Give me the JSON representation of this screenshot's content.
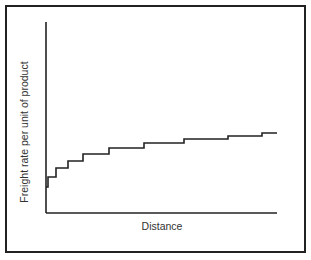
{
  "chart_data": {
    "type": "line",
    "style": "step",
    "title": "",
    "xlabel": "Distance",
    "ylabel": "Freight rate per unit of product",
    "x_ticks": [],
    "y_ticks": [],
    "grid": false,
    "legend": null,
    "note": "Qualitative stepped freight-rate curve; no numeric scale shown. Values are relative (0-100) estimated from pixel positions.",
    "xlim": [
      0,
      100
    ],
    "ylim": [
      0,
      100
    ],
    "x": [
      0,
      1,
      4,
      9,
      16,
      27,
      42,
      60,
      79,
      94,
      100
    ],
    "y": [
      16,
      22,
      27,
      30,
      33,
      36,
      38,
      40,
      41,
      43,
      43
    ],
    "steps_px": [
      [
        46,
        187
      ],
      [
        48,
        187
      ],
      [
        48,
        177
      ],
      [
        56,
        177
      ],
      [
        56,
        168
      ],
      [
        68,
        168
      ],
      [
        68,
        161
      ],
      [
        83,
        161
      ],
      [
        83,
        154
      ],
      [
        109,
        154
      ],
      [
        109,
        148
      ],
      [
        144,
        148
      ],
      [
        144,
        143
      ],
      [
        184,
        143
      ],
      [
        184,
        139
      ],
      [
        228,
        139
      ],
      [
        228,
        136
      ],
      [
        262,
        136
      ],
      [
        262,
        133
      ],
      [
        277,
        133
      ]
    ],
    "colors": {
      "line": "#222222",
      "axis": "#222222",
      "frame": "#222222"
    }
  }
}
